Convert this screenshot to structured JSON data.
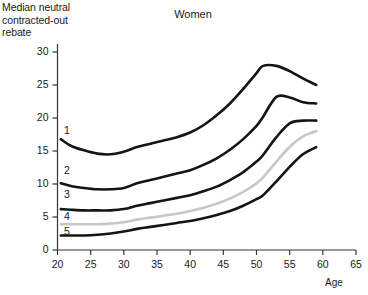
{
  "chart_data": {
    "type": "line",
    "title": "Women",
    "ylabel": "Median neutral\ncontracted-out\nrebate",
    "xlabel": "Age",
    "xlim": [
      20,
      65
    ],
    "ylim": [
      0,
      30
    ],
    "xticks": [
      20,
      25,
      30,
      35,
      40,
      45,
      50,
      55,
      60,
      65
    ],
    "yticks": [
      0,
      5,
      10,
      15,
      20,
      25,
      30
    ],
    "grid": false,
    "legend_position": "inline-left-labels",
    "series_labels": [
      "1",
      "2",
      "3",
      "4",
      "5"
    ],
    "x": [
      20.5,
      22,
      24,
      26,
      28,
      30,
      32,
      34,
      36,
      38,
      40,
      42,
      44,
      46,
      48,
      50,
      51,
      53,
      55,
      57,
      59
    ],
    "series": [
      {
        "name": "1",
        "color": "#141414",
        "values": [
          16.8,
          15.8,
          15.1,
          14.6,
          14.5,
          14.9,
          15.6,
          16.1,
          16.6,
          17.1,
          17.8,
          18.9,
          20.4,
          22.2,
          24.4,
          26.8,
          27.9,
          27.9,
          27.1,
          26.0,
          25.0
        ]
      },
      {
        "name": "2",
        "color": "#141414",
        "values": [
          10.1,
          9.7,
          9.4,
          9.2,
          9.2,
          9.4,
          10.1,
          10.6,
          11.1,
          11.6,
          12.1,
          12.9,
          13.9,
          15.2,
          16.8,
          18.8,
          20.2,
          23.2,
          23.1,
          22.4,
          22.2
        ]
      },
      {
        "name": "3",
        "color": "#141414",
        "values": [
          6.2,
          6.1,
          6.0,
          6.0,
          6.0,
          6.2,
          6.7,
          7.1,
          7.5,
          7.9,
          8.3,
          8.9,
          9.6,
          10.6,
          11.8,
          13.4,
          14.4,
          17.1,
          19.2,
          19.6,
          19.6
        ]
      },
      {
        "name": "4",
        "color": "#c7c7c7",
        "values": [
          3.9,
          3.9,
          3.9,
          3.9,
          4.0,
          4.2,
          4.6,
          4.9,
          5.2,
          5.5,
          5.9,
          6.4,
          7.0,
          7.8,
          8.8,
          10.1,
          11.0,
          13.4,
          15.6,
          17.2,
          18.0
        ]
      },
      {
        "name": "5",
        "color": "#141414",
        "values": [
          2.2,
          2.2,
          2.2,
          2.3,
          2.5,
          2.8,
          3.2,
          3.5,
          3.8,
          4.1,
          4.4,
          4.8,
          5.3,
          5.9,
          6.7,
          7.7,
          8.3,
          10.4,
          12.6,
          14.5,
          15.6
        ]
      }
    ],
    "series_label_positions": [
      {
        "label": "1",
        "value": 18.0
      },
      {
        "label": "2",
        "value": 11.9
      },
      {
        "label": "3",
        "value": 8.4
      },
      {
        "label": "4",
        "value": 5.0
      },
      {
        "label": "5",
        "value": 2.8
      }
    ],
    "axis_color": "#333333"
  }
}
